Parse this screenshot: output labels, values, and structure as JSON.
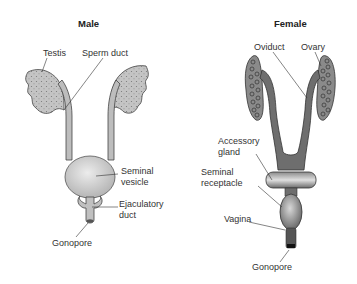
{
  "male": {
    "title": "Male",
    "labels": {
      "testis": "Testis",
      "sperm_duct": "Sperm duct",
      "seminal_vesicle_1": "Seminal",
      "seminal_vesicle_2": "vesicle",
      "ejaculatory_duct_1": "Ejaculatory",
      "ejaculatory_duct_2": "duct",
      "gonopore": "Gonopore"
    }
  },
  "female": {
    "title": "Female",
    "labels": {
      "oviduct": "Oviduct",
      "ovary": "Ovary",
      "accessory_gland_1": "Accessory",
      "accessory_gland_2": "gland",
      "seminal_receptacle_1": "Seminal",
      "seminal_receptacle_2": "receptacle",
      "vagina": "Vagina",
      "gonopore": "Gonopore"
    }
  },
  "colors": {
    "male_fill": "#bdbdbd",
    "female_fill": "#6e6e6e",
    "outline": "#333333"
  }
}
